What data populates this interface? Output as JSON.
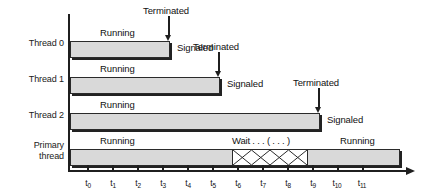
{
  "figure": {
    "type": "timing-diagram",
    "bar_fill_color": "#d9d9d9",
    "line_color": "#1f1f1f"
  },
  "axis": {
    "orientation": "horizontal",
    "arrow": "right",
    "ticks": [
      {
        "label": "t",
        "sub": "0"
      },
      {
        "label": "t",
        "sub": "1"
      },
      {
        "label": "t",
        "sub": "2"
      },
      {
        "label": "t",
        "sub": "3"
      },
      {
        "label": "t",
        "sub": "4"
      },
      {
        "label": "t",
        "sub": "5"
      },
      {
        "label": "t",
        "sub": "6"
      },
      {
        "label": "t",
        "sub": "7"
      },
      {
        "label": "t",
        "sub": "8"
      },
      {
        "label": "t",
        "sub": "9"
      },
      {
        "label": "t",
        "sub": "10"
      },
      {
        "label": "t",
        "sub": "11"
      }
    ]
  },
  "rows": [
    {
      "name": "Thread 0",
      "label": "Thread 0",
      "running_label": "Running",
      "terminated_label": "Terminated",
      "signaled_label": "Signaled",
      "bar_start_tick": 0,
      "bar_end_tick": 3
    },
    {
      "name": "Thread 1",
      "label": "Thread 1",
      "running_label": "Running",
      "terminated_label": "Terminated",
      "signaled_label": "Signaled",
      "bar_start_tick": 0,
      "bar_end_tick": 5
    },
    {
      "name": "Thread 2",
      "label": "Thread 2",
      "running_label": "Running",
      "terminated_label": "Terminated",
      "signaled_label": "Signaled",
      "bar_start_tick": 0,
      "bar_end_tick": 9
    },
    {
      "name": "Primary thread",
      "label": "Primary\nthread",
      "running_label": "Running",
      "running_label_2": "Running",
      "wait_label": "Wait . . . ( . . . )",
      "bar_start_tick": 0,
      "bar_end_tick": 12,
      "wait_start_tick": 6,
      "wait_end_tick": 9
    }
  ]
}
